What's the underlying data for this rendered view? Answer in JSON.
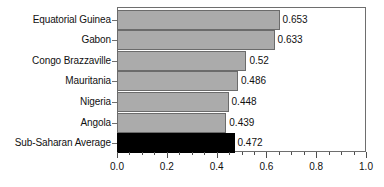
{
  "chart_data": {
    "type": "bar",
    "orientation": "horizontal",
    "title": "",
    "xlabel": "",
    "ylabel": "",
    "xlim": [
      0.0,
      1.0
    ],
    "grid": false,
    "legend": null,
    "xticks": [
      "0.0",
      "0.2",
      "0.4",
      "0.6",
      "0.8",
      "1.0"
    ],
    "xtick_values": [
      0.0,
      0.2,
      0.4,
      0.6,
      0.8,
      1.0
    ],
    "minor_tick_step": 0.05,
    "categories": [
      "Equatorial Guinea",
      "Gabon",
      "Congo Brazzaville",
      "Mauritania",
      "Nigeria",
      "Angola",
      "Sub-Saharan Average"
    ],
    "values": [
      0.653,
      0.633,
      0.52,
      0.486,
      0.448,
      0.439,
      0.472
    ],
    "value_labels": [
      "0.653",
      "0.633",
      "0.52",
      "0.486",
      "0.448",
      "0.439",
      "0.472"
    ],
    "bar_colors": [
      "#ababab",
      "#ababab",
      "#ababab",
      "#ababab",
      "#ababab",
      "#ababab",
      "#000000"
    ],
    "highlight_category": "Sub-Saharan Average",
    "colors": {
      "bar_gray": "#ababab",
      "bar_highlight": "#000000",
      "bar_border": "#6b6b6b",
      "axis": "#6e6e6e",
      "text": "#111111",
      "background": "#ffffff"
    }
  }
}
